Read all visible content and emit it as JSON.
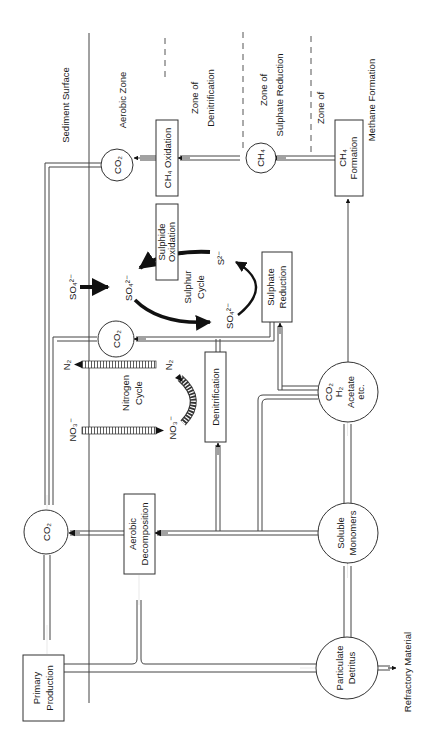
{
  "diagram": {
    "orientation": "rotated 90deg counter-clockwise",
    "zones": {
      "sediment_surface": "Sediment Surface",
      "aerobic": "Aerobic Zone",
      "denitrification_line1": "Zone of",
      "denitrification_line2": "Denitrification",
      "sulphate_line1": "Zone of",
      "sulphate_line2": "Sulphate Reduction",
      "methane_line1": "Zone of",
      "methane_line2": "Methane Formation"
    },
    "nodes": {
      "co2_top": "CO₂",
      "ch4_oxidation": "CH₄ Oxidation",
      "ch4": "CH₄",
      "ch4_formation_line1": "CH₄",
      "ch4_formation_line2": "Formation",
      "sulphide_oxidation_line1": "Sulphide",
      "sulphide_oxidation_line2": "Oxidation",
      "sulphate_reduction_line1": "Sulphate",
      "sulphate_reduction_line2": "Reduction",
      "co2_mid": "CO₂",
      "denitrification": "Denitrification",
      "fermentation_line1": "CO₂",
      "fermentation_line2": "H₂",
      "fermentation_line3": "Acetate",
      "fermentation_line4": "etc.",
      "co2_left": "CO₂",
      "aerobic_decomposition_line1": "Aerobic",
      "aerobic_decomposition_line2": "Decomposition",
      "soluble_monomers_line1": "Soluble",
      "soluble_monomers_line2": "Monomers",
      "primary_production_line1": "Primary",
      "primary_production_line2": "Production",
      "particulate_detritus_line1": "Particulate",
      "particulate_detritus_line2": "Detritus",
      "refractory": "Refractory Material"
    },
    "sulphur_cycle": {
      "label_line1": "Sulphur",
      "label_line2": "Cycle",
      "so4_in": "SO₄²⁻",
      "so4_left": "SO₄²⁻",
      "so4_right": "SO₄²⁻",
      "s2": "S²⁻"
    },
    "nitrogen_cycle": {
      "label_line1": "Nitrogen",
      "label_line2": "Cycle",
      "n2_out": "N₂",
      "n2_in": "N₂",
      "no3_in": "NO₃⁻",
      "no3": "NO₃⁻"
    }
  }
}
